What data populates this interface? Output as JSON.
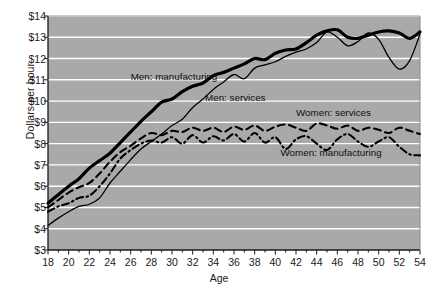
{
  "chart_data": {
    "type": "line",
    "title": "",
    "xlabel": "Age",
    "ylabel": "Dollars per hour",
    "xlim": [
      18,
      54
    ],
    "ylim": [
      3,
      14
    ],
    "grid": true,
    "legend_position": "inline-annotations",
    "plot_background": "#a9a9a9",
    "gridline_color": "#ffffff",
    "axis_color": "#1a1a1a",
    "ytick_labels": [
      "$14",
      "$13",
      "$12",
      "$11",
      "$10",
      "$9",
      "$8",
      "$7",
      "$6",
      "$5",
      "$4",
      "$3"
    ],
    "ytick_values": [
      14,
      13,
      12,
      11,
      10,
      9,
      8,
      7,
      6,
      5,
      4,
      3
    ],
    "xtick_labels": [
      "18",
      "20",
      "22",
      "24",
      "26",
      "28",
      "30",
      "32",
      "34",
      "36",
      "38",
      "40",
      "42",
      "44",
      "46",
      "48",
      "50",
      "52",
      "54"
    ],
    "xtick_values": [
      18,
      20,
      22,
      24,
      26,
      28,
      30,
      32,
      34,
      36,
      38,
      40,
      42,
      44,
      46,
      48,
      50,
      52,
      54
    ],
    "x": [
      18,
      19,
      20,
      21,
      22,
      23,
      24,
      25,
      26,
      27,
      28,
      29,
      30,
      31,
      32,
      33,
      34,
      35,
      36,
      37,
      38,
      39,
      40,
      41,
      42,
      43,
      44,
      45,
      46,
      47,
      48,
      49,
      50,
      51,
      52,
      53,
      54
    ],
    "series": [
      {
        "name": "Men: manufacturing",
        "style": "solid-thick",
        "color": "#000000",
        "width": 3.2,
        "label_x": 26,
        "label_y": 11.15,
        "values": [
          5.2,
          5.6,
          6.0,
          6.35,
          6.85,
          7.2,
          7.55,
          8.05,
          8.55,
          9.05,
          9.5,
          9.95,
          10.1,
          10.45,
          10.7,
          10.85,
          11.2,
          11.35,
          11.55,
          11.75,
          12.0,
          11.95,
          12.25,
          12.4,
          12.45,
          12.75,
          13.1,
          13.3,
          13.35,
          13.0,
          12.95,
          13.1,
          13.25,
          13.3,
          13.2,
          12.95,
          13.25
        ]
      },
      {
        "name": "Men: services",
        "style": "solid-thin",
        "color": "#000000",
        "width": 1.3,
        "label_x": 33.2,
        "label_y": 10.15,
        "values": [
          4.15,
          4.5,
          4.8,
          5.05,
          5.15,
          5.45,
          6.15,
          6.7,
          7.25,
          7.75,
          8.1,
          8.45,
          8.85,
          9.15,
          9.7,
          10.1,
          10.55,
          10.9,
          11.25,
          11.05,
          11.55,
          11.7,
          11.85,
          12.1,
          12.3,
          12.45,
          12.75,
          13.25,
          13.0,
          12.6,
          12.8,
          13.2,
          12.9,
          12.05,
          11.5,
          11.9,
          13.15
        ]
      },
      {
        "name": "Women: services",
        "style": "dashed",
        "color": "#000000",
        "width": 2.1,
        "label_x": 42,
        "label_y": 9.45,
        "values": [
          5.0,
          5.35,
          5.7,
          5.95,
          6.15,
          6.6,
          7.15,
          7.6,
          7.9,
          8.25,
          8.5,
          8.4,
          8.6,
          8.55,
          8.75,
          8.6,
          8.75,
          8.55,
          8.8,
          8.65,
          8.85,
          8.6,
          8.8,
          8.9,
          8.75,
          8.6,
          8.95,
          8.85,
          8.7,
          8.85,
          8.6,
          8.75,
          8.65,
          8.5,
          8.75,
          8.6,
          8.45
        ]
      },
      {
        "name": "Women: manufacturing",
        "style": "dash-dot",
        "color": "#000000",
        "width": 2.1,
        "label_x": 40.5,
        "label_y": 7.55,
        "values": [
          4.8,
          5.05,
          5.2,
          5.45,
          5.55,
          6.0,
          6.6,
          7.3,
          7.7,
          8.0,
          8.15,
          8.05,
          8.3,
          8.0,
          8.4,
          8.05,
          8.35,
          8.15,
          8.45,
          8.1,
          8.5,
          8.05,
          8.3,
          7.75,
          8.2,
          8.35,
          8.0,
          7.7,
          8.2,
          8.45,
          8.1,
          7.85,
          8.1,
          8.3,
          7.85,
          7.5,
          7.45
        ]
      }
    ]
  }
}
